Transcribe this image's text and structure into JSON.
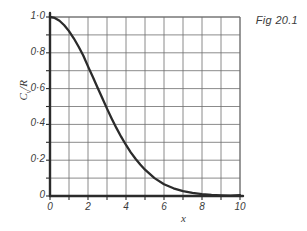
{
  "figure": {
    "caption": "Fig 20.1",
    "background_color": "#ffffff",
    "ink_color": "#2b2b2b",
    "grid_color": "#6d6d6d"
  },
  "chart_data": {
    "type": "line",
    "title": "Fig 20.1",
    "xlabel": "x",
    "ylabel": "Cv/R",
    "ylabel_base": "C",
    "ylabel_sub": "v",
    "ylabel_tail": "/R",
    "xlim": [
      0,
      10
    ],
    "ylim": [
      0,
      1.0
    ],
    "grid": true,
    "grid_major_x": 1,
    "grid_major_y": 0.1,
    "legend": "none",
    "xticks": [
      0,
      1,
      2,
      3,
      4,
      5,
      6,
      7,
      8,
      9,
      10
    ],
    "xtick_labels": [
      "0",
      "",
      "2",
      "",
      "4",
      "",
      "6",
      "",
      "8",
      "",
      "10"
    ],
    "xtick_labels_shown": [
      "0",
      "2",
      "4",
      "6",
      "8",
      "10"
    ],
    "yticks": [
      0,
      0.1,
      0.2,
      0.3,
      0.4,
      0.5,
      0.6,
      0.7,
      0.8,
      0.9,
      1.0
    ],
    "ytick_labels": [
      "0",
      "",
      "0·2",
      "",
      "0·4",
      "",
      "0·6",
      "",
      "0·8",
      "",
      "1·0"
    ],
    "ytick_labels_shown": [
      "0",
      "0·2",
      "0·4",
      "0·6",
      "0·8",
      "1·0"
    ],
    "series": [
      {
        "name": "Einstein heat capacity",
        "x": [
          0,
          0.25,
          0.5,
          0.75,
          1.0,
          1.25,
          1.5,
          1.75,
          2.0,
          2.25,
          2.5,
          2.75,
          3.0,
          3.25,
          3.5,
          3.75,
          4.0,
          4.25,
          4.5,
          4.75,
          5.0,
          5.5,
          6.0,
          6.5,
          7.0,
          7.5,
          8.0,
          8.5,
          9.0,
          9.5,
          10.0
        ],
        "y": [
          1.0,
          0.995,
          0.979,
          0.954,
          0.921,
          0.881,
          0.835,
          0.785,
          0.724,
          0.666,
          0.606,
          0.547,
          0.488,
          0.432,
          0.379,
          0.33,
          0.285,
          0.244,
          0.208,
          0.176,
          0.147,
          0.1,
          0.066,
          0.043,
          0.027,
          0.017,
          0.011,
          0.0066,
          0.004,
          0.0024,
          0.0045
        ]
      }
    ]
  },
  "axes": {
    "x_axis_name": "x-axis",
    "y_axis_name": "y-axis"
  }
}
